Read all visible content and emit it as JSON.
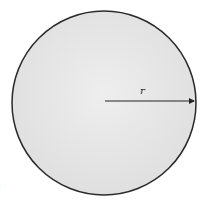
{
  "diagram": {
    "title_cropped": "",
    "circle": {
      "cx": 104,
      "cy": 103,
      "r": 92,
      "fill": "#e6e6e6",
      "stroke": "#2a2a2a"
    },
    "radius_arrow": {
      "x1": 105,
      "y1": 101,
      "x2": 196,
      "y2": 101,
      "color": "#222222"
    },
    "radius_label": "r",
    "bottom_left_mark": ")"
  }
}
